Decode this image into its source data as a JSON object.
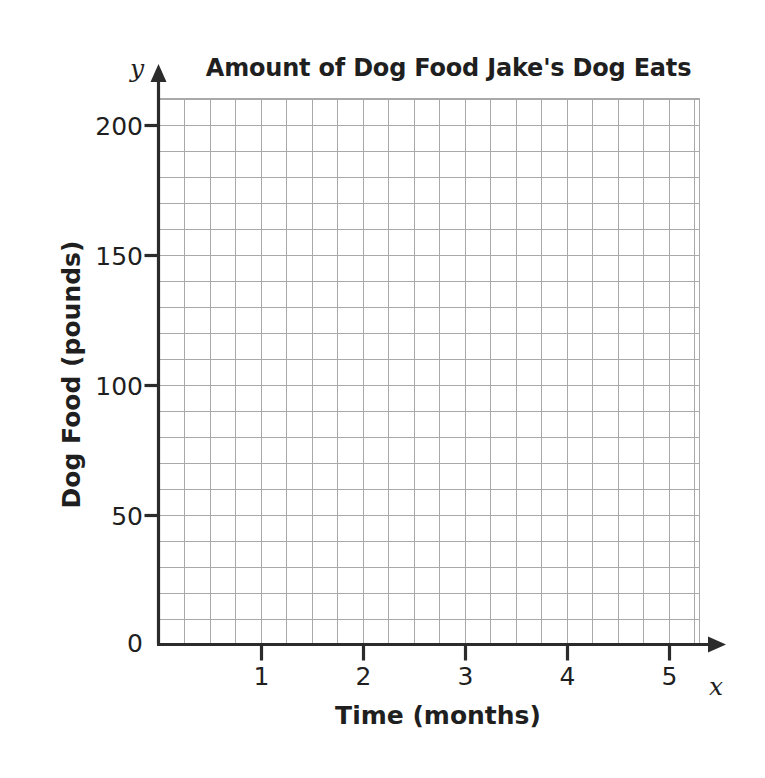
{
  "chart_data": {
    "type": "line",
    "title": "Amount of Dog Food Jake's Dog Eats",
    "xlabel": "Time (months)",
    "ylabel": "Dog Food (pounds)",
    "x_axis_variable": "x",
    "y_axis_variable": "y",
    "xlim": [
      0,
      5.5
    ],
    "ylim": [
      0,
      210
    ],
    "x_ticks": [
      1,
      2,
      3,
      4,
      5
    ],
    "x_tick_labels": [
      "1",
      "2",
      "3",
      "4",
      "5"
    ],
    "y_ticks": [
      0,
      50,
      100,
      150,
      200
    ],
    "y_tick_labels": [
      "0",
      "50",
      "100",
      "150",
      "200"
    ],
    "x_minor_step": 0.25,
    "y_minor_step": 10,
    "grid": true,
    "grid_color": "#a9a9a9",
    "axis_color": "#2b2b2b",
    "legend": null,
    "series": [],
    "values": [],
    "annotations": [],
    "note": "Blank coordinate grid; no data points plotted"
  },
  "axis_arrows": {
    "x_arrow": "arrow-right",
    "y_arrow": "arrow-up"
  },
  "colors": {
    "background": "#ffffff",
    "text": "#1f1f1f",
    "grid": "#a9a9a9",
    "axis": "#2b2b2b"
  }
}
